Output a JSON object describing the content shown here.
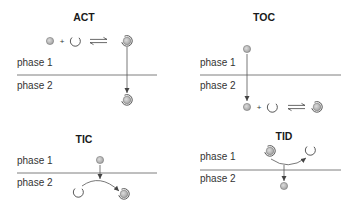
{
  "panels": [
    {
      "id": "act",
      "title": "ACT",
      "phase1_label": "phase 1",
      "phase2_label": "phase 2",
      "reaction_location": "phase 1",
      "reaction": {
        "reactant_a": "ligand",
        "plus": "+",
        "reactant_b": "extractant",
        "arrow": "equilibrium",
        "product": "complex"
      },
      "transfer": "complex moves from phase 1 to phase 2"
    },
    {
      "id": "toc",
      "title": "TOC",
      "phase1_label": "phase 1",
      "phase2_label": "phase 2",
      "reaction_location": "phase 2",
      "reaction": {
        "reactant_a": "ligand",
        "plus": "+",
        "reactant_b": "extractant",
        "arrow": "equilibrium",
        "product": "complex"
      },
      "transfer": "ligand moves from phase 1 to phase 2, then reacts"
    },
    {
      "id": "tic",
      "title": "TIC",
      "phase1_label": "phase 1",
      "phase2_label": "phase 2",
      "reaction_location": "interface",
      "reaction": {
        "reactant_a": "ligand",
        "reactant_b": "extractant",
        "product": "complex"
      },
      "transfer": "ligand crosses interface and combines with extractant into complex in phase 2"
    },
    {
      "id": "tid",
      "title": "TID",
      "phase1_label": "phase 1",
      "phase2_label": "phase 2",
      "reaction_location": "interface",
      "reaction": {
        "reactant": "complex",
        "product_a": "extractant",
        "product_b": "ligand"
      },
      "transfer": "complex dissociates at interface; ligand released into phase 2, extractant stays in phase 1"
    }
  ],
  "legend_icons": {
    "ligand": "small-gray-circle-icon",
    "extractant": "open-crescent-icon",
    "complex": "ringed-circle-icon"
  },
  "colors": {
    "ink": "#333333",
    "divider": "#6f6f6f",
    "circle_fill": "#b8b8b8",
    "background": "#ffffff"
  }
}
